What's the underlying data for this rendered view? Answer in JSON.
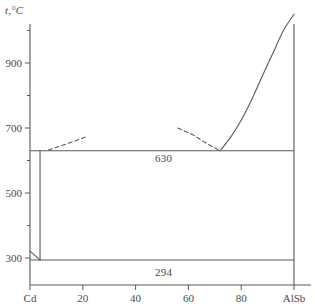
{
  "figure": {
    "kind": "phase-diagram",
    "axis_label_y": "t,°C",
    "system_left": "Cd",
    "system_right": "AlSb"
  },
  "annotations": {
    "eutectic_upper": "630",
    "eutectic_lower": "294"
  },
  "chart_data": {
    "type": "line",
    "title": "",
    "subtitle": "",
    "xlabel": "",
    "ylabel": "t,°C",
    "xlim": [
      0,
      100
    ],
    "ylim": [
      250,
      1020
    ],
    "grid": false,
    "legend": null,
    "x_tick_values": [
      0,
      20,
      40,
      60,
      80,
      100
    ],
    "x_tick_labels": [
      "Cd",
      "20",
      "40",
      "60",
      "80",
      "AlSb"
    ],
    "x_minor_ticks": [
      10,
      30,
      50,
      70,
      90
    ],
    "y_tick_values": [
      300,
      500,
      700,
      900
    ],
    "y_tick_labels": [
      "300",
      "500",
      "700",
      "900"
    ],
    "y_minor_ticks": [
      400,
      600,
      800,
      1000
    ],
    "horizontal_lines": [
      {
        "label": "630",
        "temperature": 630,
        "x_from": 0,
        "x_to": 100
      },
      {
        "label": "294",
        "temperature": 294,
        "x_from": 0,
        "x_to": 100
      }
    ],
    "series": [
      {
        "name": "Cd left boundary (vertical)",
        "style": "solid",
        "x": [
          3.8,
          3.8
        ],
        "y": [
          294,
          630
        ]
      },
      {
        "name": "Cd melting spur",
        "style": "solid",
        "x": [
          0,
          3.8
        ],
        "y": [
          321,
          294
        ]
      },
      {
        "name": "liquidus left (extrapolated)",
        "style": "dashed",
        "x": [
          7,
          12,
          17,
          22
        ],
        "y": [
          632,
          646,
          660,
          675
        ]
      },
      {
        "name": "liquidus right (extrapolated)",
        "style": "dashed",
        "x": [
          56,
          62,
          67,
          72
        ],
        "y": [
          700,
          678,
          652,
          630
        ]
      },
      {
        "name": "liquidus AlSb branch",
        "style": "solid",
        "x": [
          72,
          76,
          80,
          84,
          88,
          92,
          96,
          100
        ],
        "y": [
          630,
          672,
          724,
          788,
          860,
          930,
          1000,
          1050
        ]
      }
    ]
  }
}
